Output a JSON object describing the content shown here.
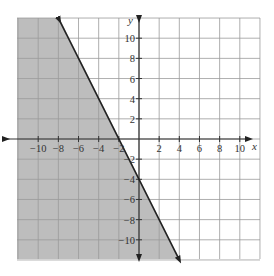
{
  "chart_data": {
    "type": "line",
    "title": "",
    "xlabel": "x",
    "ylabel": "y",
    "xlim": [
      -12,
      11
    ],
    "ylim": [
      -12,
      12
    ],
    "grid": true,
    "grid_step": 2,
    "x_ticks": [
      -10,
      -8,
      -6,
      -4,
      -2,
      2,
      4,
      6,
      8,
      10
    ],
    "y_ticks": [
      10,
      8,
      6,
      4,
      2,
      -2,
      -4,
      -6,
      -8,
      -10
    ],
    "x_tick_labels": [
      "−10",
      "−8",
      "−6",
      "−4",
      "−2",
      "2",
      "4",
      "6",
      "8",
      "10"
    ],
    "y_tick_labels": [
      "10",
      "8",
      "6",
      "4",
      "2",
      "−2",
      "−4",
      "−6",
      "−8",
      "−10"
    ],
    "series": [
      {
        "name": "boundary line y = -2x - 4",
        "style": "solid",
        "x": [
          -7.9,
          -2,
          0,
          4
        ],
        "y": [
          11.8,
          0,
          -4,
          -12
        ]
      }
    ],
    "shaded_region": {
      "description": "y <= -2x - 4 (region below/left of the line)",
      "color": "#bdbdbd"
    },
    "annotations": []
  },
  "colors": {
    "shade": "#bdbdbd",
    "grid": "#9a9a9a",
    "axis": "#333333",
    "line": "#222222",
    "background": "#ffffff"
  }
}
